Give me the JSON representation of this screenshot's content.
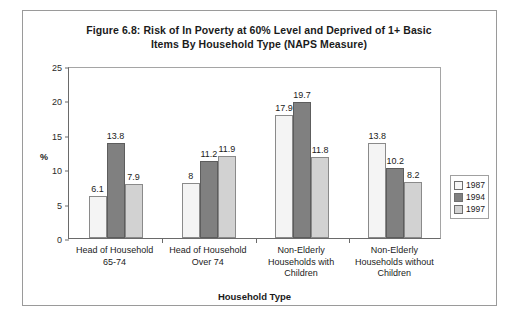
{
  "chart_data": {
    "type": "bar",
    "title": "Figure 6.8: Risk of In Poverty at 60% Level and Deprived of 1+ Basic Items By Household Type (NAPS Measure)",
    "title_line1": "Figure 6.8: Risk of In Poverty at 60% Level and Deprived of 1+ Basic",
    "title_line2": "Items By Household Type (NAPS Measure)",
    "xlabel": "Household Type",
    "ylabel": "%",
    "ylim": [
      0,
      25
    ],
    "yticks": [
      0,
      5,
      10,
      15,
      20,
      25
    ],
    "ytick_labels": [
      "0",
      "5",
      "10",
      "15",
      "20",
      "25"
    ],
    "grid": false,
    "legend_position": "right",
    "categories": [
      "Head of Household 65-74",
      "Head of Household Over 74",
      "Non-Elderly Households with Children",
      "Non-Elderly Households without Children"
    ],
    "category_lines": [
      [
        "Head of Household",
        "65-74"
      ],
      [
        "Head of Household",
        "Over 74"
      ],
      [
        "Non-Elderly",
        "Households with",
        "Children"
      ],
      [
        "Non-Elderly",
        "Households without",
        "Children"
      ]
    ],
    "series": [
      {
        "name": "1987",
        "color": "#f4f4f4",
        "values": [
          6.1,
          8,
          17.9,
          13.8
        ],
        "labels": [
          "6.1",
          "8",
          "17.9",
          "13.8"
        ]
      },
      {
        "name": "1994",
        "color": "#808080",
        "values": [
          13.8,
          11.2,
          19.7,
          10.2
        ],
        "labels": [
          "13.8",
          "11.2",
          "19.7",
          "10.2"
        ]
      },
      {
        "name": "1997",
        "color": "#d2d2d2",
        "values": [
          7.9,
          11.9,
          11.8,
          8.2
        ],
        "labels": [
          "7.9",
          "11.9",
          "11.8",
          "8.2"
        ]
      }
    ]
  }
}
